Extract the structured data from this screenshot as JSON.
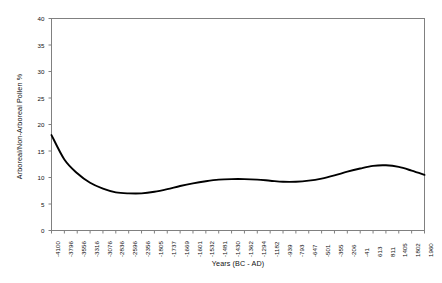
{
  "chart_data": {
    "type": "line",
    "title": "",
    "xlabel": "Years (BC - AD)",
    "ylabel": "Arboreal/Non-Arboreal Pollen %",
    "ylim": [
      0,
      40
    ],
    "yticks": [
      0,
      5,
      10,
      15,
      20,
      25,
      30,
      35,
      40
    ],
    "grid": false,
    "legend": "none",
    "categories": [
      "-4100",
      "-3796",
      "-3556",
      "-3316",
      "-3076",
      "-2836",
      "-2596",
      "-2356",
      "-1805",
      "-1737",
      "-1669",
      "-1601",
      "-1532",
      "-1481",
      "-1430",
      "-1362",
      "-1294",
      "-1182",
      "-939",
      "-793",
      "-647",
      "-501",
      "-355",
      "-206",
      "-41",
      "613",
      "811",
      "1405",
      "1802",
      "1960"
    ],
    "values": [
      18.0,
      13.4,
      10.8,
      9.0,
      7.9,
      7.2,
      7.0,
      7.0,
      7.3,
      7.8,
      8.4,
      8.9,
      9.3,
      9.6,
      9.7,
      9.7,
      9.6,
      9.4,
      9.2,
      9.2,
      9.4,
      9.8,
      10.4,
      11.1,
      11.7,
      12.2,
      12.3,
      12.0,
      11.3,
      10.5
    ],
    "series_name": "Arboreal/Non-Arboreal Pollen %",
    "line_color": "#000000",
    "axis_color": "#808080"
  }
}
